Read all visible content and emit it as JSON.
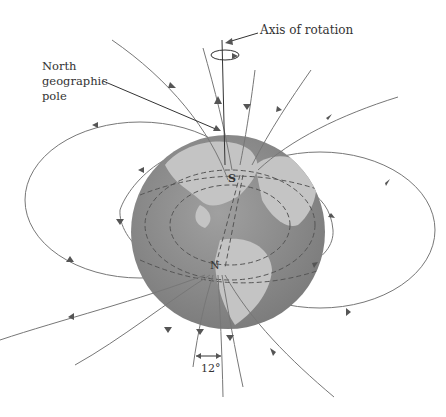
{
  "labels": {
    "axis_of_rotation": "Axis of rotation",
    "north_geo_1": "North",
    "north_geo_2": "geographic",
    "north_geo_3": "pole",
    "s_pole": "S",
    "n_pole": "N",
    "angle": "12°"
  },
  "colors": {
    "ocean": "#8c8c8c",
    "land": "#c4c4c4",
    "field_line": "#777777"
  }
}
